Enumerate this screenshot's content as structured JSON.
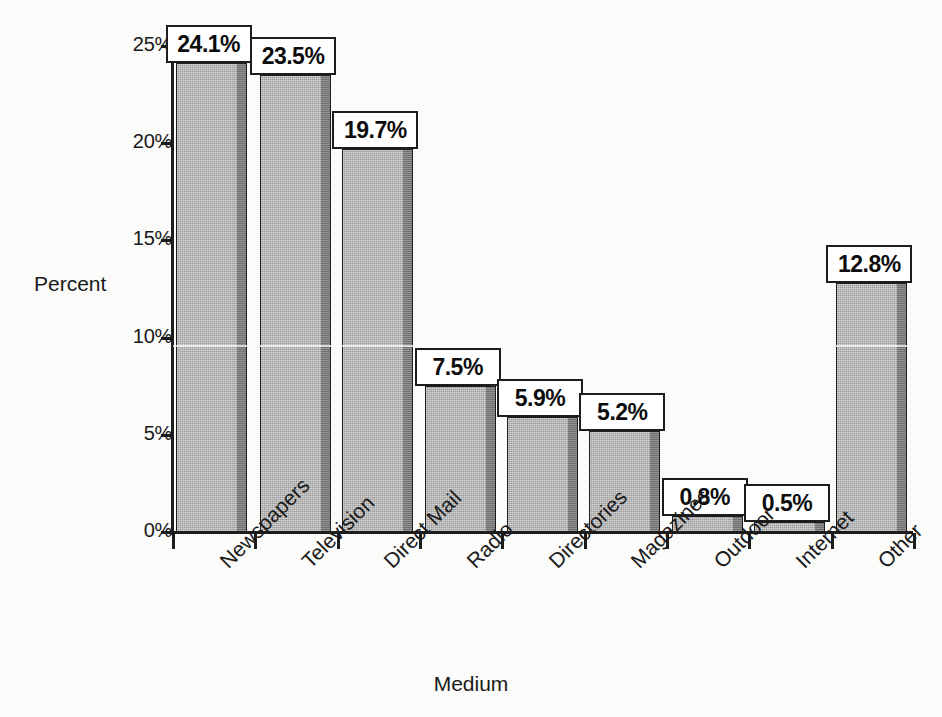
{
  "chart_data": {
    "type": "bar",
    "title": "",
    "subtitle": "",
    "xlabel": "Medium",
    "ylabel": "Percent",
    "categories": [
      "Newspapers",
      "Television",
      "Direct Mail",
      "Radio",
      "Directories",
      "Magazines",
      "Outdoor",
      "Internet",
      "Other"
    ],
    "values": [
      24.1,
      23.5,
      19.7,
      7.5,
      5.9,
      5.2,
      0.8,
      0.5,
      12.8
    ],
    "data_labels": [
      "24.1%",
      "23.5%",
      "19.7%",
      "7.5%",
      "5.9%",
      "5.2%",
      "0.8%",
      "0.5%",
      "12.8%"
    ],
    "ylim": [
      0,
      25
    ],
    "y_ticks": [
      0,
      5,
      10,
      15,
      20,
      25
    ],
    "y_tick_labels": [
      "0%",
      "5%",
      "10%",
      "15%",
      "20%",
      "25%"
    ],
    "grid": false,
    "legend": "none",
    "bar_color": "#adadad",
    "bar_shade_color": "#7d7d7d",
    "bar_outline_color": "#1d1d1d",
    "label_box_fill": "#ffffff",
    "label_box_border": "#1d1d1d",
    "background_color": "#fbfbfa",
    "text_color": "#1a1a1a",
    "category_label_rotation": -45
  }
}
